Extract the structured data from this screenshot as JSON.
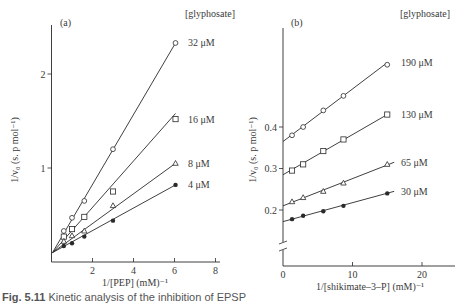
{
  "figure": {
    "caption_label": "Fig. 5.11",
    "caption_text": "Kinetic analysis of the inhibition of EPSP"
  },
  "colors": {
    "ink": "#2a2a2a",
    "background": "#ffffff"
  },
  "chart_data": [
    {
      "type": "line",
      "panel": "(a)",
      "title": "",
      "xlabel": "1/[PEP]  (mM)⁻¹",
      "ylabel": "1/v₀ (s. p mol⁻¹)",
      "xlim": [
        0,
        8.3
      ],
      "ylim": [
        0,
        2.5
      ],
      "xticks": [
        2,
        4,
        6,
        8
      ],
      "yticks": [
        1,
        2
      ],
      "grid": false,
      "legend_title": "[glyphosate]",
      "legend_position": "right, at line ends",
      "series": [
        {
          "name": "32 μM",
          "marker": "open-circle",
          "x": [
            0.6,
            1.0,
            1.6,
            3.0,
            6.05
          ],
          "y": [
            0.33,
            0.47,
            0.65,
            1.2,
            2.33
          ],
          "fit": {
            "x0": 0.05,
            "y0": 0.1,
            "x1": 6.05,
            "y1": 2.33
          }
        },
        {
          "name": "16 μM",
          "marker": "open-square",
          "x": [
            0.6,
            1.0,
            1.6,
            3.0,
            6.05
          ],
          "y": [
            0.27,
            0.35,
            0.48,
            0.75,
            1.52
          ],
          "fit": {
            "x0": 0.05,
            "y0": 0.1,
            "x1": 6.05,
            "y1": 1.58
          }
        },
        {
          "name": "8 μM",
          "marker": "open-triangle",
          "x": [
            0.6,
            1.0,
            1.6,
            3.0,
            6.05
          ],
          "y": [
            0.22,
            0.28,
            0.33,
            0.6,
            1.05
          ],
          "fit": {
            "x0": 0.05,
            "y0": 0.1,
            "x1": 6.05,
            "y1": 1.05
          }
        },
        {
          "name": "4 μM",
          "marker": "filled-circle",
          "x": [
            0.6,
            1.0,
            1.6,
            3.0,
            6.05
          ],
          "y": [
            0.17,
            0.2,
            0.27,
            0.44,
            0.82
          ],
          "fit": {
            "x0": 0.05,
            "y0": 0.1,
            "x1": 6.05,
            "y1": 0.82
          }
        }
      ]
    },
    {
      "type": "line",
      "panel": "(b)",
      "title": "",
      "xlabel": "1/[shikimate–3–P]  (mM)⁻¹",
      "ylabel": "1/v₀ (s. p mol⁻¹)",
      "xlim": [
        0,
        25
      ],
      "ylim": [
        0.1,
        0.6
      ],
      "axis_break": "y-axis break below 0.2",
      "xticks": [
        0,
        10,
        20
      ],
      "yticks": [
        0.2,
        0.3,
        0.4
      ],
      "grid": false,
      "legend_title": "[glyphosate]",
      "legend_position": "right, at line ends",
      "series": [
        {
          "name": "190 μM",
          "marker": "open-circle",
          "x": [
            1.3,
            2.9,
            5.8,
            8.7,
            15.0
          ],
          "y": [
            0.38,
            0.4,
            0.44,
            0.475,
            0.55
          ],
          "fit": {
            "x0": 0,
            "y0": 0.365,
            "x1": 15.0,
            "y1": 0.555
          }
        },
        {
          "name": "130 μM",
          "marker": "open-square",
          "x": [
            1.3,
            2.9,
            5.8,
            8.7,
            15.0
          ],
          "y": [
            0.295,
            0.31,
            0.342,
            0.37,
            0.43
          ],
          "fit": {
            "x0": 0,
            "y0": 0.285,
            "x1": 15.0,
            "y1": 0.43
          }
        },
        {
          "name": "65 μM",
          "marker": "open-triangle",
          "x": [
            1.3,
            2.9,
            5.8,
            8.7,
            15.0
          ],
          "y": [
            0.22,
            0.23,
            0.245,
            0.265,
            0.31
          ],
          "fit": {
            "x0": 0,
            "y0": 0.21,
            "x1": 16.0,
            "y1": 0.315
          }
        },
        {
          "name": "30 μM",
          "marker": "filled-circle",
          "x": [
            1.3,
            2.9,
            5.8,
            8.7,
            15.0
          ],
          "y": [
            0.178,
            0.186,
            0.197,
            0.21,
            0.24
          ],
          "fit": {
            "x0": 0,
            "y0": 0.172,
            "x1": 16.0,
            "y1": 0.245
          }
        }
      ]
    }
  ]
}
